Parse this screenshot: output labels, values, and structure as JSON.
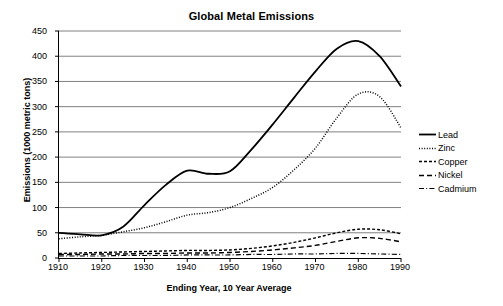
{
  "chart_data": {
    "type": "line",
    "title": "Global Metal Emissions",
    "xlabel": "Ending Year, 10 Year Average",
    "ylabel": "Emissions (1000 metric tons)",
    "xlim": [
      1910,
      1990
    ],
    "ylim": [
      0,
      450
    ],
    "xticks": [
      1910,
      1920,
      1930,
      1940,
      1950,
      1960,
      1970,
      1980,
      1990
    ],
    "yticks": [
      0,
      50,
      100,
      150,
      200,
      250,
      300,
      350,
      400,
      450
    ],
    "grid": "horizontal",
    "legend_position": "right",
    "x": [
      1910,
      1915,
      1920,
      1925,
      1930,
      1935,
      1940,
      1945,
      1950,
      1955,
      1960,
      1965,
      1970,
      1975,
      1980,
      1985,
      1990
    ],
    "series": [
      {
        "name": "Lead",
        "style": "solid",
        "color": "#000000",
        "values": [
          50,
          47,
          45,
          62,
          105,
          145,
          173,
          167,
          172,
          215,
          265,
          318,
          370,
          415,
          430,
          400,
          340
        ]
      },
      {
        "name": "Zinc",
        "style": "dotted",
        "color": "#000000",
        "values": [
          38,
          42,
          45,
          52,
          60,
          72,
          85,
          90,
          100,
          118,
          140,
          175,
          218,
          278,
          325,
          320,
          258
        ]
      },
      {
        "name": "Copper",
        "style": "dashed",
        "color": "#000000",
        "values": [
          9,
          10,
          11,
          12,
          13,
          14,
          15,
          15,
          16,
          19,
          24,
          31,
          40,
          50,
          57,
          56,
          48
        ]
      },
      {
        "name": "Nickel",
        "style": "longdash",
        "color": "#000000",
        "values": [
          7,
          7,
          8,
          8,
          9,
          9,
          10,
          10,
          11,
          13,
          16,
          20,
          25,
          33,
          40,
          39,
          32
        ]
      },
      {
        "name": "Cadmium",
        "style": "dashdot",
        "color": "#000000",
        "values": [
          4,
          4,
          4,
          5,
          5,
          5,
          6,
          6,
          6,
          7,
          7,
          8,
          8,
          9,
          9,
          8,
          7
        ]
      }
    ]
  },
  "axis": {
    "y_tick_labels": [
      "0",
      "50",
      "100",
      "150",
      "200",
      "250",
      "300",
      "350",
      "400",
      "450"
    ],
    "x_tick_labels": [
      "1910",
      "1920",
      "1930",
      "1940",
      "1950",
      "1960",
      "1970",
      "1980",
      "1990"
    ]
  },
  "legend": {
    "items": [
      {
        "label": "Lead"
      },
      {
        "label": "Zinc"
      },
      {
        "label": "Copper"
      },
      {
        "label": "Nickel"
      },
      {
        "label": "Cadmium"
      }
    ]
  },
  "style": {
    "gridline_color": "#808080",
    "axis_color": "#000000",
    "plot_background": "#ffffff"
  }
}
